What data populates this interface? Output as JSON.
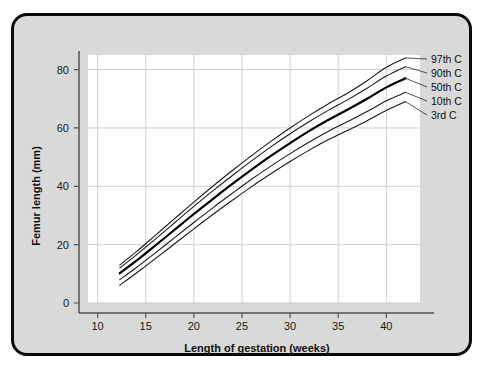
{
  "figure": {
    "background_color": "#d9d9d9",
    "border_color": "#0a0a0a",
    "plot_background_color": "#ffffff",
    "grid_color": "#cccccc",
    "axis_color": "#555555"
  },
  "chart_data": {
    "type": "line",
    "title": "",
    "xlabel": "Length of gestation (weeks)",
    "ylabel": "Femur length (mm)",
    "xlim": [
      9,
      43.5
    ],
    "ylim": [
      0,
      85
    ],
    "xticks": [
      10,
      15,
      20,
      25,
      30,
      35,
      40
    ],
    "yticks": [
      0,
      20,
      40,
      60,
      80
    ],
    "xtick_labels": [
      "10",
      "15",
      "20",
      "25",
      "30",
      "35",
      "40"
    ],
    "ytick_labels": [
      "0",
      "20",
      "40",
      "60",
      "80"
    ],
    "grid": true,
    "legend_position": "right-outside",
    "x": [
      12.3,
      14,
      16,
      18,
      20,
      22,
      24,
      26,
      28,
      30,
      32,
      34,
      36,
      38,
      40,
      42
    ],
    "series": [
      {
        "name": "97th C",
        "label": "97th C",
        "color": "#1a1a1a",
        "width": 1.1,
        "values": [
          13.0,
          17.5,
          23.2,
          28.9,
          34.6,
          40.1,
          45.4,
          50.5,
          55.4,
          60.0,
          64.3,
          68.3,
          72.0,
          76.2,
          80.8,
          84.0
        ]
      },
      {
        "name": "90th C",
        "label": "90th C",
        "color": "#1a1a1a",
        "width": 1.1,
        "values": [
          12.0,
          16.4,
          21.9,
          27.5,
          33.1,
          38.5,
          43.7,
          48.7,
          53.5,
          58.0,
          62.2,
          66.1,
          69.7,
          73.6,
          77.8,
          81.0
        ]
      },
      {
        "name": "50th C",
        "label": "50th C",
        "color": "#000000",
        "width": 2.2,
        "values": [
          10.2,
          14.4,
          19.7,
          25.1,
          30.5,
          35.7,
          40.8,
          45.7,
          50.4,
          54.8,
          59.0,
          62.8,
          66.3,
          70.0,
          73.9,
          77.0
        ]
      },
      {
        "name": "10th C",
        "label": "10th C",
        "color": "#1a1a1a",
        "width": 1.1,
        "values": [
          8.0,
          12.1,
          17.2,
          22.4,
          27.6,
          32.7,
          37.6,
          42.4,
          46.9,
          51.2,
          55.2,
          58.9,
          62.2,
          65.6,
          69.3,
          72.2
        ]
      },
      {
        "name": "3rd C",
        "label": "3rd C",
        "color": "#1a1a1a",
        "width": 1.1,
        "values": [
          6.1,
          10.2,
          15.2,
          20.3,
          25.4,
          30.4,
          35.2,
          39.9,
          44.3,
          48.5,
          52.4,
          56.0,
          59.2,
          62.5,
          66.0,
          69.0
        ]
      }
    ]
  }
}
